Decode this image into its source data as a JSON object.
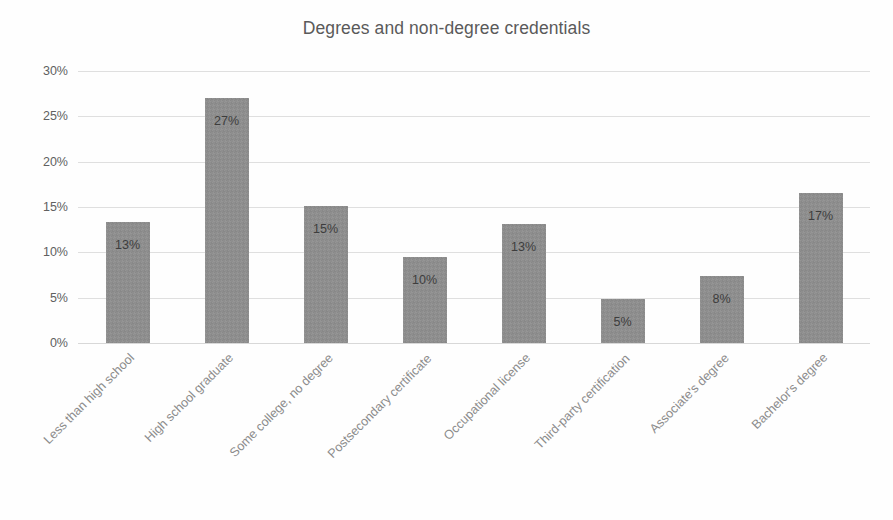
{
  "chart_data": {
    "type": "bar",
    "title": "Degrees and non-degree credentials",
    "xlabel": "",
    "ylabel": "",
    "ylim": [
      0,
      30
    ],
    "grid": true,
    "legend": false,
    "y_tick_labels": [
      "30%",
      "25%",
      "20%",
      "15%",
      "10%",
      "5%",
      "0%"
    ],
    "y_ticks": [
      30,
      25,
      20,
      15,
      10,
      5,
      0
    ],
    "categories": [
      "Less than high school",
      "High school graduate",
      "Some college, no degree",
      "Postsecondary certificate",
      "Occupational license",
      "Third-party certification",
      "Associate's degree",
      "Bachelor's degree"
    ],
    "values": [
      13.3,
      27.0,
      15.1,
      9.5,
      13.1,
      4.9,
      7.4,
      16.6
    ],
    "data_labels": [
      "13%",
      "27%",
      "15%",
      "10%",
      "13%",
      "5%",
      "8%",
      "17%"
    ],
    "bar_color": "#8e8e8e",
    "gridline_color": "#dfdfdf",
    "title_color": "#5a5a5a",
    "tick_label_color": "#8c8c8c",
    "axis_label_color": "#606060",
    "background_color": "#fefefe"
  }
}
